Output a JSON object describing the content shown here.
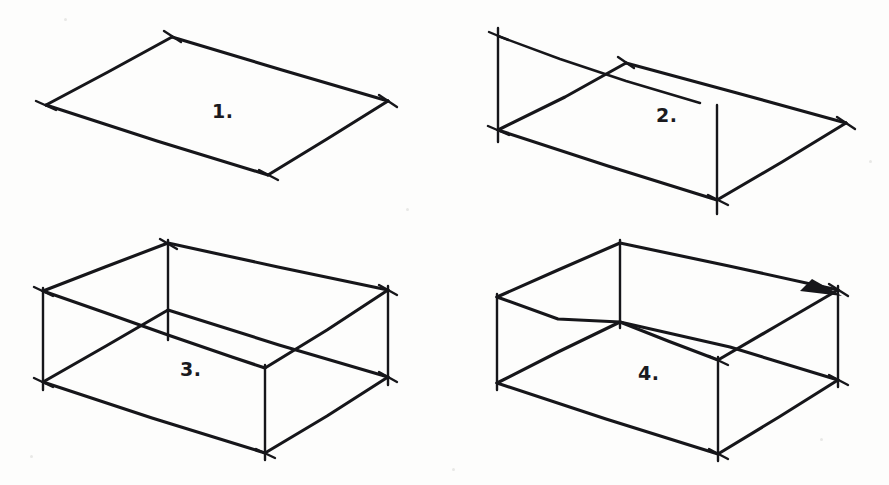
{
  "page": {
    "background_color": "#fdfdfc",
    "ink_color": "#16161a",
    "width": 889,
    "height": 485
  },
  "figures": [
    {
      "id": "figure-1",
      "label": "1.",
      "label_x": 212,
      "label_y": 100,
      "description": "Parallelogram base outline in isometric view with corner overshoot tick marks",
      "stage": "base rectangle only"
    },
    {
      "id": "figure-2",
      "label": "2.",
      "label_x": 656,
      "label_y": 104,
      "description": "Base parallelogram with two short vertical edges at back-left and front-right corners",
      "stage": "base plus two vertical edges"
    },
    {
      "id": "figure-3",
      "label": "3.",
      "label_x": 180,
      "label_y": 358,
      "description": "Open box with four vertical edges and partially drawn upper rim",
      "stage": "walls raised"
    },
    {
      "id": "figure-4",
      "label": "4.",
      "label_x": 638,
      "label_y": 362,
      "description": "Completed box with full upper rim and a solid arrowhead marker on the top back-right edge",
      "stage": "completed box with arrow marker"
    }
  ],
  "annotations": [
    {
      "name": "arrowhead-marker",
      "figure": "figure-4",
      "shape": "solid triangle",
      "x": 822,
      "y": 288
    }
  ]
}
